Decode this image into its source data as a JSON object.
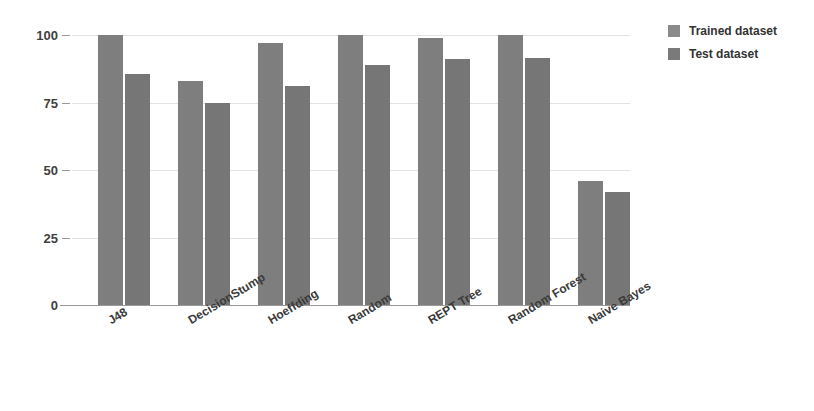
{
  "chart_data": {
    "type": "bar",
    "title": "",
    "subtitle": "",
    "xlabel": "",
    "ylabel": "",
    "ylim": [
      0,
      100
    ],
    "yticks": [
      0,
      25,
      50,
      75,
      100
    ],
    "ytick_labels": [
      "0",
      "25",
      "50",
      "75",
      "100"
    ],
    "grid": true,
    "legend_position": "right-top",
    "categories": [
      "J48",
      "DecisionStump",
      "Hoeffding",
      "Random",
      "REPT Tree",
      "Random Forest",
      "Naive Bayes"
    ],
    "series": [
      {
        "name": "Trained dataset",
        "color": "#7e7e7e",
        "values": [
          100,
          83,
          97,
          100,
          99,
          100,
          46
        ]
      },
      {
        "name": "Test dataset",
        "color": "#767676",
        "values": [
          85.5,
          75,
          81,
          89,
          91,
          91.5,
          42
        ]
      }
    ]
  },
  "legend": {
    "items": [
      {
        "label": "Trained dataset",
        "color": "#8a8a8a"
      },
      {
        "label": "Test dataset",
        "color": "#7a7a7a"
      }
    ]
  }
}
